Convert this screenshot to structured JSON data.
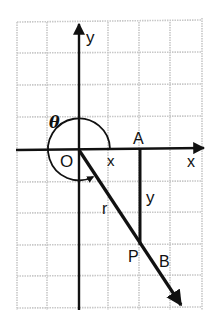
{
  "diagram": {
    "type": "trigonometric angle in standard position",
    "colors": {
      "grid": "#c8c8c8",
      "ink": "#111111",
      "background": "#ffffff"
    },
    "labels": {
      "y_axis": "y",
      "x_axis": "x",
      "origin": "O",
      "theta": "θ",
      "point_a": "A",
      "point_p": "P",
      "point_b": "B",
      "segment_x": "x",
      "segment_y": "y",
      "radius": "r"
    }
  }
}
